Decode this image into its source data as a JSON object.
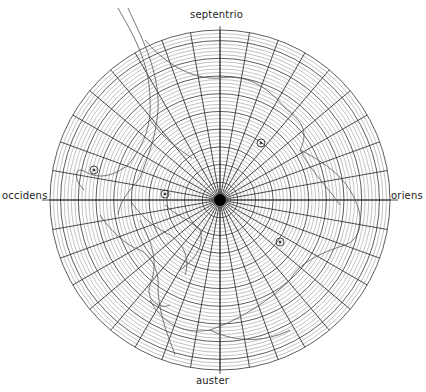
{
  "map": {
    "type": "polar-projection",
    "center": [
      220,
      200
    ],
    "radius": 170,
    "spokes": 36,
    "rings": 48,
    "major_ring_every": 5,
    "grid_color": "#333333",
    "coast_color": "#555555"
  },
  "compass": {
    "north": "septentrio",
    "west": "occidens",
    "east": "oriens",
    "south": "auster"
  },
  "markers": [
    {
      "kind": "circle",
      "x": 94,
      "y": 170
    },
    {
      "kind": "circle",
      "x": 165,
      "y": 194
    },
    {
      "kind": "circle",
      "x": 261,
      "y": 143
    },
    {
      "kind": "circle",
      "x": 280,
      "y": 242
    }
  ]
}
